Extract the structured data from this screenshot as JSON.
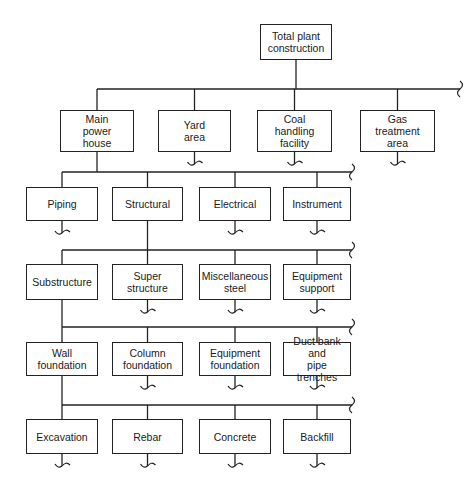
{
  "root": {
    "id": "total",
    "label": "Total plant construction",
    "lines": [
      "Total plant",
      "construction"
    ]
  },
  "levels": [
    {
      "parent": "total",
      "nodes": [
        {
          "id": "main-power-house",
          "lines": [
            "Main",
            "power",
            "house"
          ],
          "continues": false
        },
        {
          "id": "yard-area",
          "lines": [
            "Yard",
            "area"
          ],
          "continues": true
        },
        {
          "id": "coal-handling-facility",
          "lines": [
            "Coal",
            "handling",
            "facility"
          ],
          "continues": true
        },
        {
          "id": "gas-treatment-area",
          "lines": [
            "Gas",
            "treatment",
            "area"
          ],
          "continues": true
        }
      ]
    },
    {
      "parent": "main-power-house",
      "nodes": [
        {
          "id": "piping",
          "lines": [
            "Piping"
          ],
          "continues": true
        },
        {
          "id": "structural",
          "lines": [
            "Structural"
          ],
          "continues": false
        },
        {
          "id": "electrical",
          "lines": [
            "Electrical"
          ],
          "continues": true
        },
        {
          "id": "instrument",
          "lines": [
            "Instrument"
          ],
          "continues": true
        }
      ]
    },
    {
      "parent": "structural",
      "nodes": [
        {
          "id": "substructure",
          "lines": [
            "Substructure"
          ],
          "continues": false
        },
        {
          "id": "super-structure",
          "lines": [
            "Super",
            "structure"
          ],
          "continues": true
        },
        {
          "id": "miscellaneous-steel",
          "lines": [
            "Miscellaneous",
            "steel"
          ],
          "continues": true
        },
        {
          "id": "equipment-support",
          "lines": [
            "Equipment",
            "support"
          ],
          "continues": true
        }
      ]
    },
    {
      "parent": "substructure",
      "nodes": [
        {
          "id": "wall-foundation",
          "lines": [
            "Wall",
            "foundation"
          ],
          "continues": false
        },
        {
          "id": "column-foundation",
          "lines": [
            "Column",
            "foundation"
          ],
          "continues": true
        },
        {
          "id": "equipment-foundation",
          "lines": [
            "Equipment",
            "foundation"
          ],
          "continues": true
        },
        {
          "id": "duct-bank-pipe-trenches",
          "lines": [
            "Duct bank and",
            "pipe trenches"
          ],
          "continues": true
        }
      ]
    },
    {
      "parent": "wall-foundation",
      "nodes": [
        {
          "id": "excavation",
          "lines": [
            "Excavation"
          ],
          "continues": true
        },
        {
          "id": "rebar",
          "lines": [
            "Rebar"
          ],
          "continues": true
        },
        {
          "id": "concrete",
          "lines": [
            "Concrete"
          ],
          "continues": true
        },
        {
          "id": "backfill",
          "lines": [
            "Backfill"
          ],
          "continues": true
        }
      ]
    }
  ]
}
